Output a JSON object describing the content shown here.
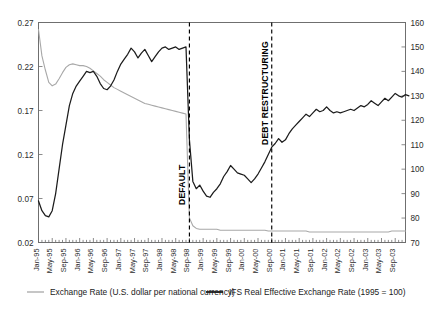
{
  "chart_data": {
    "type": "line",
    "title": "",
    "xlabel": "",
    "grid": false,
    "legend_position": "bottom",
    "x_start": "Jan-95",
    "x_end": "Dec-03",
    "x_tick_labels": [
      "Jan-95",
      "May-95",
      "Sep-95",
      "Jan-96",
      "May-96",
      "Sep-96",
      "Jan-97",
      "May-97",
      "Sep-97",
      "Jan-98",
      "May-98",
      "Sep-98",
      "Jan-99",
      "May-99",
      "Sep-99",
      "Jan-00",
      "May-00",
      "Sep-00",
      "Jan-01",
      "May-01",
      "Sep-01",
      "Jan-02",
      "May-02",
      "Sep-02",
      "Jan-03",
      "May-03",
      "Sep-03"
    ],
    "x_tick_step_months": 4,
    "x_minor_tick_step_months": 1,
    "axes": [
      {
        "id": "left",
        "ylabel": "",
        "ylim": [
          0.02,
          0.27
        ],
        "ticks": [
          0.02,
          0.07,
          0.12,
          0.17,
          0.22,
          0.27
        ],
        "tick_labels": [
          "0.02",
          "0.07",
          "0.12",
          "0.17",
          "0.22",
          "0.27"
        ]
      },
      {
        "id": "right",
        "ylabel": "",
        "ylim": [
          70,
          160
        ],
        "ticks": [
          70,
          80,
          90,
          100,
          110,
          120,
          130,
          140,
          150,
          160
        ],
        "tick_labels": [
          "70",
          "80",
          "90",
          "100",
          "110",
          "120",
          "130",
          "140",
          "150",
          "160"
        ]
      }
    ],
    "series": [
      {
        "name": "Exchange Rate (U.S. dollar per national currency)",
        "axis": "left",
        "color": "#a8a8a8",
        "style": "thin-line",
        "values": [
          0.262,
          0.232,
          0.216,
          0.202,
          0.198,
          0.2,
          0.206,
          0.213,
          0.219,
          0.222,
          0.223,
          0.222,
          0.221,
          0.221,
          0.22,
          0.218,
          0.215,
          0.212,
          0.209,
          0.205,
          0.202,
          0.199,
          0.196,
          0.194,
          0.192,
          0.19,
          0.188,
          0.186,
          0.184,
          0.182,
          0.18,
          0.178,
          0.177,
          0.176,
          0.175,
          0.174,
          0.173,
          0.172,
          0.171,
          0.17,
          0.169,
          0.168,
          0.167,
          0.166,
          0.048,
          0.039,
          0.036,
          0.035,
          0.035,
          0.035,
          0.035,
          0.035,
          0.035,
          0.034,
          0.034,
          0.034,
          0.034,
          0.034,
          0.034,
          0.034,
          0.034,
          0.034,
          0.034,
          0.034,
          0.034,
          0.034,
          0.034,
          0.033,
          0.033,
          0.033,
          0.033,
          0.033,
          0.033,
          0.033,
          0.033,
          0.033,
          0.033,
          0.033,
          0.033,
          0.032,
          0.032,
          0.032,
          0.032,
          0.032,
          0.032,
          0.032,
          0.032,
          0.032,
          0.032,
          0.032,
          0.032,
          0.032,
          0.032,
          0.032,
          0.032,
          0.032,
          0.032,
          0.032,
          0.032,
          0.032,
          0.032,
          0.032,
          0.032,
          0.033,
          0.033,
          0.033,
          0.033,
          0.033
        ]
      },
      {
        "name": "IFS Real Effective Exchange Rate (1995 = 100)",
        "axis": "right",
        "color": "#1c1c1c",
        "style": "thick-line",
        "values": [
          87.0,
          83.0,
          81.0,
          80.5,
          83.0,
          90.0,
          100.0,
          110.0,
          118.0,
          126.0,
          131.0,
          134.0,
          136.0,
          138.0,
          140.0,
          139.5,
          140.0,
          138.0,
          135.0,
          133.0,
          132.5,
          134.0,
          136.5,
          140.0,
          143.0,
          145.0,
          147.0,
          149.5,
          148.0,
          145.5,
          147.5,
          149.0,
          146.5,
          144.0,
          146.0,
          148.0,
          149.5,
          150.0,
          149.0,
          149.5,
          150.0,
          149.0,
          149.5,
          150.0,
          112.0,
          95.0,
          92.0,
          93.5,
          91.0,
          89.0,
          88.5,
          90.5,
          92.0,
          94.0,
          97.0,
          99.0,
          101.5,
          100.0,
          98.5,
          98.0,
          97.5,
          96.0,
          94.5,
          96.0,
          98.0,
          100.5,
          103.0,
          106.0,
          109.0,
          110.5,
          112.5,
          111.0,
          112.0,
          114.5,
          116.5,
          118.0,
          119.5,
          121.0,
          122.5,
          121.5,
          123.0,
          124.5,
          123.5,
          124.0,
          125.5,
          124.0,
          123.0,
          123.5,
          123.0,
          123.5,
          124.0,
          124.5,
          124.0,
          125.0,
          126.0,
          125.5,
          126.5,
          128.0,
          127.0,
          126.0,
          127.5,
          129.0,
          128.0,
          129.5,
          131.0,
          130.0,
          129.5,
          130.5,
          130.0
        ]
      }
    ],
    "annotations": [
      {
        "label": "DEFAULT",
        "at_x": "Sep-98",
        "orientation": "vertical",
        "line_style": "dashed"
      },
      {
        "label": "DEBT RESTRUCTURING",
        "at_x": "Sep-00",
        "orientation": "vertical",
        "line_style": "dashed"
      }
    ]
  },
  "legend": {
    "items": [
      {
        "label": "Exchange Rate (U.S. dollar per national currency)",
        "color": "#a8a8a8"
      },
      {
        "label": "IFS Real Effective Exchange Rate (1995 = 100)",
        "color": "#1c1c1c"
      }
    ]
  }
}
